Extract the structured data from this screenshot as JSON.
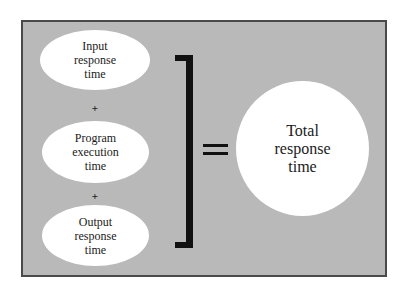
{
  "diagram": {
    "components": [
      {
        "lines": [
          "Input",
          "response",
          "time"
        ]
      },
      {
        "lines": [
          "Program",
          "execution",
          "time"
        ]
      },
      {
        "lines": [
          "Output",
          "response",
          "time"
        ]
      }
    ],
    "operators": {
      "plus_1": "+",
      "plus_2": "+",
      "equals": "="
    },
    "result": {
      "lines": [
        "Total",
        "response",
        "time"
      ]
    },
    "colors": {
      "panel_background": "#b9b9b9",
      "panel_border": "#4a4a4a",
      "shape_fill": "#ffffff",
      "ink": "#111111"
    }
  }
}
